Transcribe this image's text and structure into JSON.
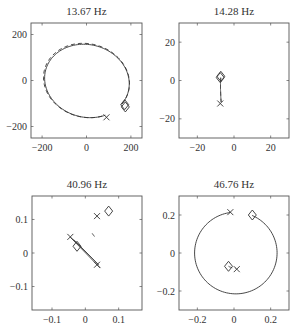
{
  "figure": {
    "panels_layout": "2x2",
    "line_color": "#333333",
    "frame_color": "#555555"
  },
  "chart_data": [
    {
      "type": "line",
      "title": "13.67 Hz",
      "xlabel": "",
      "ylabel": "",
      "xlim": [
        -250,
        250
      ],
      "ylim": [
        -250,
        250
      ],
      "xticks": [
        -200,
        0,
        200
      ],
      "yticks": [
        -200,
        0,
        200
      ],
      "xtick_labels": [
        "−200",
        "0",
        "200"
      ],
      "ytick_labels": [
        "−200",
        "0",
        "200"
      ],
      "grid": false,
      "frame": {
        "x": 31,
        "y": 23,
        "w": 111,
        "h": 115
      },
      "series": [
        {
          "name": "solid",
          "style": "solid",
          "kind": "ellipse-arc",
          "center": [
            2,
            -2
          ],
          "rx": 192,
          "ry": 158,
          "rotation_deg": -12,
          "start": [
            175,
            -115
          ],
          "end": [
            90,
            -160
          ]
        },
        {
          "name": "dashed",
          "style": "dashed",
          "kind": "ellipse-arc",
          "center": [
            0,
            0
          ],
          "rx": 195,
          "ry": 160,
          "rotation_deg": -12,
          "start": [
            175,
            -110
          ],
          "end": [
            85,
            -160
          ]
        }
      ],
      "markers": [
        {
          "shape": "diamond",
          "x": 175,
          "y": -115
        },
        {
          "shape": "diamond",
          "x": 172,
          "y": -105
        },
        {
          "shape": "x",
          "x": 90,
          "y": -160
        }
      ]
    },
    {
      "type": "line",
      "title": "14.28 Hz",
      "xlabel": "",
      "ylabel": "",
      "xlim": [
        -30,
        30
      ],
      "ylim": [
        -30,
        30
      ],
      "xticks": [
        -20,
        0,
        20
      ],
      "yticks": [
        -20,
        0,
        20
      ],
      "xtick_labels": [
        "−20",
        "0",
        "20"
      ],
      "ytick_labels": [
        "−20",
        "0",
        "20"
      ],
      "grid": false,
      "frame": {
        "x": 179,
        "y": 23,
        "w": 110,
        "h": 115
      },
      "series": [
        {
          "name": "solid",
          "style": "solid",
          "kind": "ellipse-arc",
          "center": [
            0,
            0
          ],
          "rx": 7.3,
          "ry": 27,
          "rotation_deg": -2,
          "start": [
            -7.5,
            1.5
          ],
          "end": [
            -7.5,
            -12
          ]
        },
        {
          "name": "dashed",
          "style": "dashed",
          "kind": "ellipse-arc",
          "center": [
            0.3,
            0
          ],
          "rx": 7.6,
          "ry": 27.5,
          "rotation_deg": -2,
          "start": [
            -7.5,
            1.5
          ],
          "end": [
            -7.5,
            -12
          ]
        }
      ],
      "markers": [
        {
          "shape": "diamond",
          "x": -7.5,
          "y": 1.5
        },
        {
          "shape": "diamond",
          "x": -7.2,
          "y": 2.2
        },
        {
          "shape": "x",
          "x": -7.5,
          "y": -12
        }
      ]
    },
    {
      "type": "line",
      "title": "40.96 Hz",
      "xlabel": "",
      "ylabel": "",
      "xlim": [
        -0.16,
        0.17
      ],
      "ylim": [
        -0.17,
        0.17
      ],
      "xticks": [
        -0.1,
        0,
        0.1
      ],
      "yticks": [
        -0.1,
        0,
        0.1
      ],
      "xtick_labels": [
        "−0.1",
        "0",
        "0.1"
      ],
      "ytick_labels": [
        "−0.1",
        "0",
        "0.1"
      ],
      "grid": false,
      "frame": {
        "x": 32,
        "y": 196,
        "w": 110,
        "h": 114
      },
      "series": [
        {
          "name": "dashed",
          "style": "dashed",
          "kind": "ellipse-arc",
          "center": [
            0,
            0
          ],
          "rx": 0.05,
          "ry": 0.155,
          "rotation_deg": 32,
          "start": [
            0.07,
            0.125
          ],
          "end": [
            0.035,
            0.11
          ]
        },
        {
          "name": "solid-a",
          "style": "solid",
          "kind": "segment",
          "start": [
            -0.045,
            0.047
          ],
          "end": [
            0.045,
            -0.045
          ]
        },
        {
          "name": "solid-b",
          "style": "solid",
          "kind": "segment",
          "start": [
            -0.035,
            0.04
          ],
          "end": [
            0.04,
            -0.035
          ]
        }
      ],
      "markers": [
        {
          "shape": "diamond",
          "x": 0.07,
          "y": 0.125
        },
        {
          "shape": "x",
          "x": 0.035,
          "y": 0.11
        },
        {
          "shape": "x",
          "x": -0.045,
          "y": 0.048
        },
        {
          "shape": "diamond",
          "x": -0.025,
          "y": 0.02
        },
        {
          "shape": "x",
          "x": 0.035,
          "y": -0.035
        }
      ]
    },
    {
      "type": "line",
      "title": "46.76 Hz",
      "xlabel": "",
      "ylabel": "",
      "xlim": [
        -0.3,
        0.3
      ],
      "ylim": [
        -0.3,
        0.3
      ],
      "xticks": [
        -0.2,
        0,
        0.2
      ],
      "yticks": [
        -0.2,
        0,
        0.2
      ],
      "xtick_labels": [
        "−0.2",
        "0",
        "0.2"
      ],
      "ytick_labels": [
        "−0.2",
        "0",
        "0.2"
      ],
      "grid": false,
      "frame": {
        "x": 179,
        "y": 196,
        "w": 110,
        "h": 114
      },
      "series": [
        {
          "name": "solid",
          "style": "solid",
          "kind": "ellipse-arc",
          "center": [
            0.01,
            0
          ],
          "rx": 0.225,
          "ry": 0.215,
          "rotation_deg": 0,
          "start": [
            -0.02,
            0.21
          ],
          "end": [
            0.1,
            0.2
          ]
        },
        {
          "name": "dashed",
          "style": "dashed",
          "kind": "ellipse-arc",
          "center": [
            0.01,
            0.005
          ],
          "rx": 0.085,
          "ry": 0.085,
          "rotation_deg": 0,
          "start": [
            -0.03,
            -0.07
          ],
          "end": [
            0.01,
            -0.085
          ]
        }
      ],
      "markers": [
        {
          "shape": "x",
          "x": -0.02,
          "y": 0.215
        },
        {
          "shape": "diamond",
          "x": 0.1,
          "y": 0.2
        },
        {
          "shape": "diamond",
          "x": -0.03,
          "y": -0.07
        },
        {
          "shape": "x",
          "x": 0.015,
          "y": -0.085
        }
      ]
    }
  ]
}
